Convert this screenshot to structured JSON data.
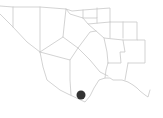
{
  "map": {
    "boundary_color": "#c8c8c8",
    "marker": {
      "label": "location-marker",
      "color": "#333333",
      "cx": 81,
      "cy": 95,
      "r": 4.5
    }
  }
}
